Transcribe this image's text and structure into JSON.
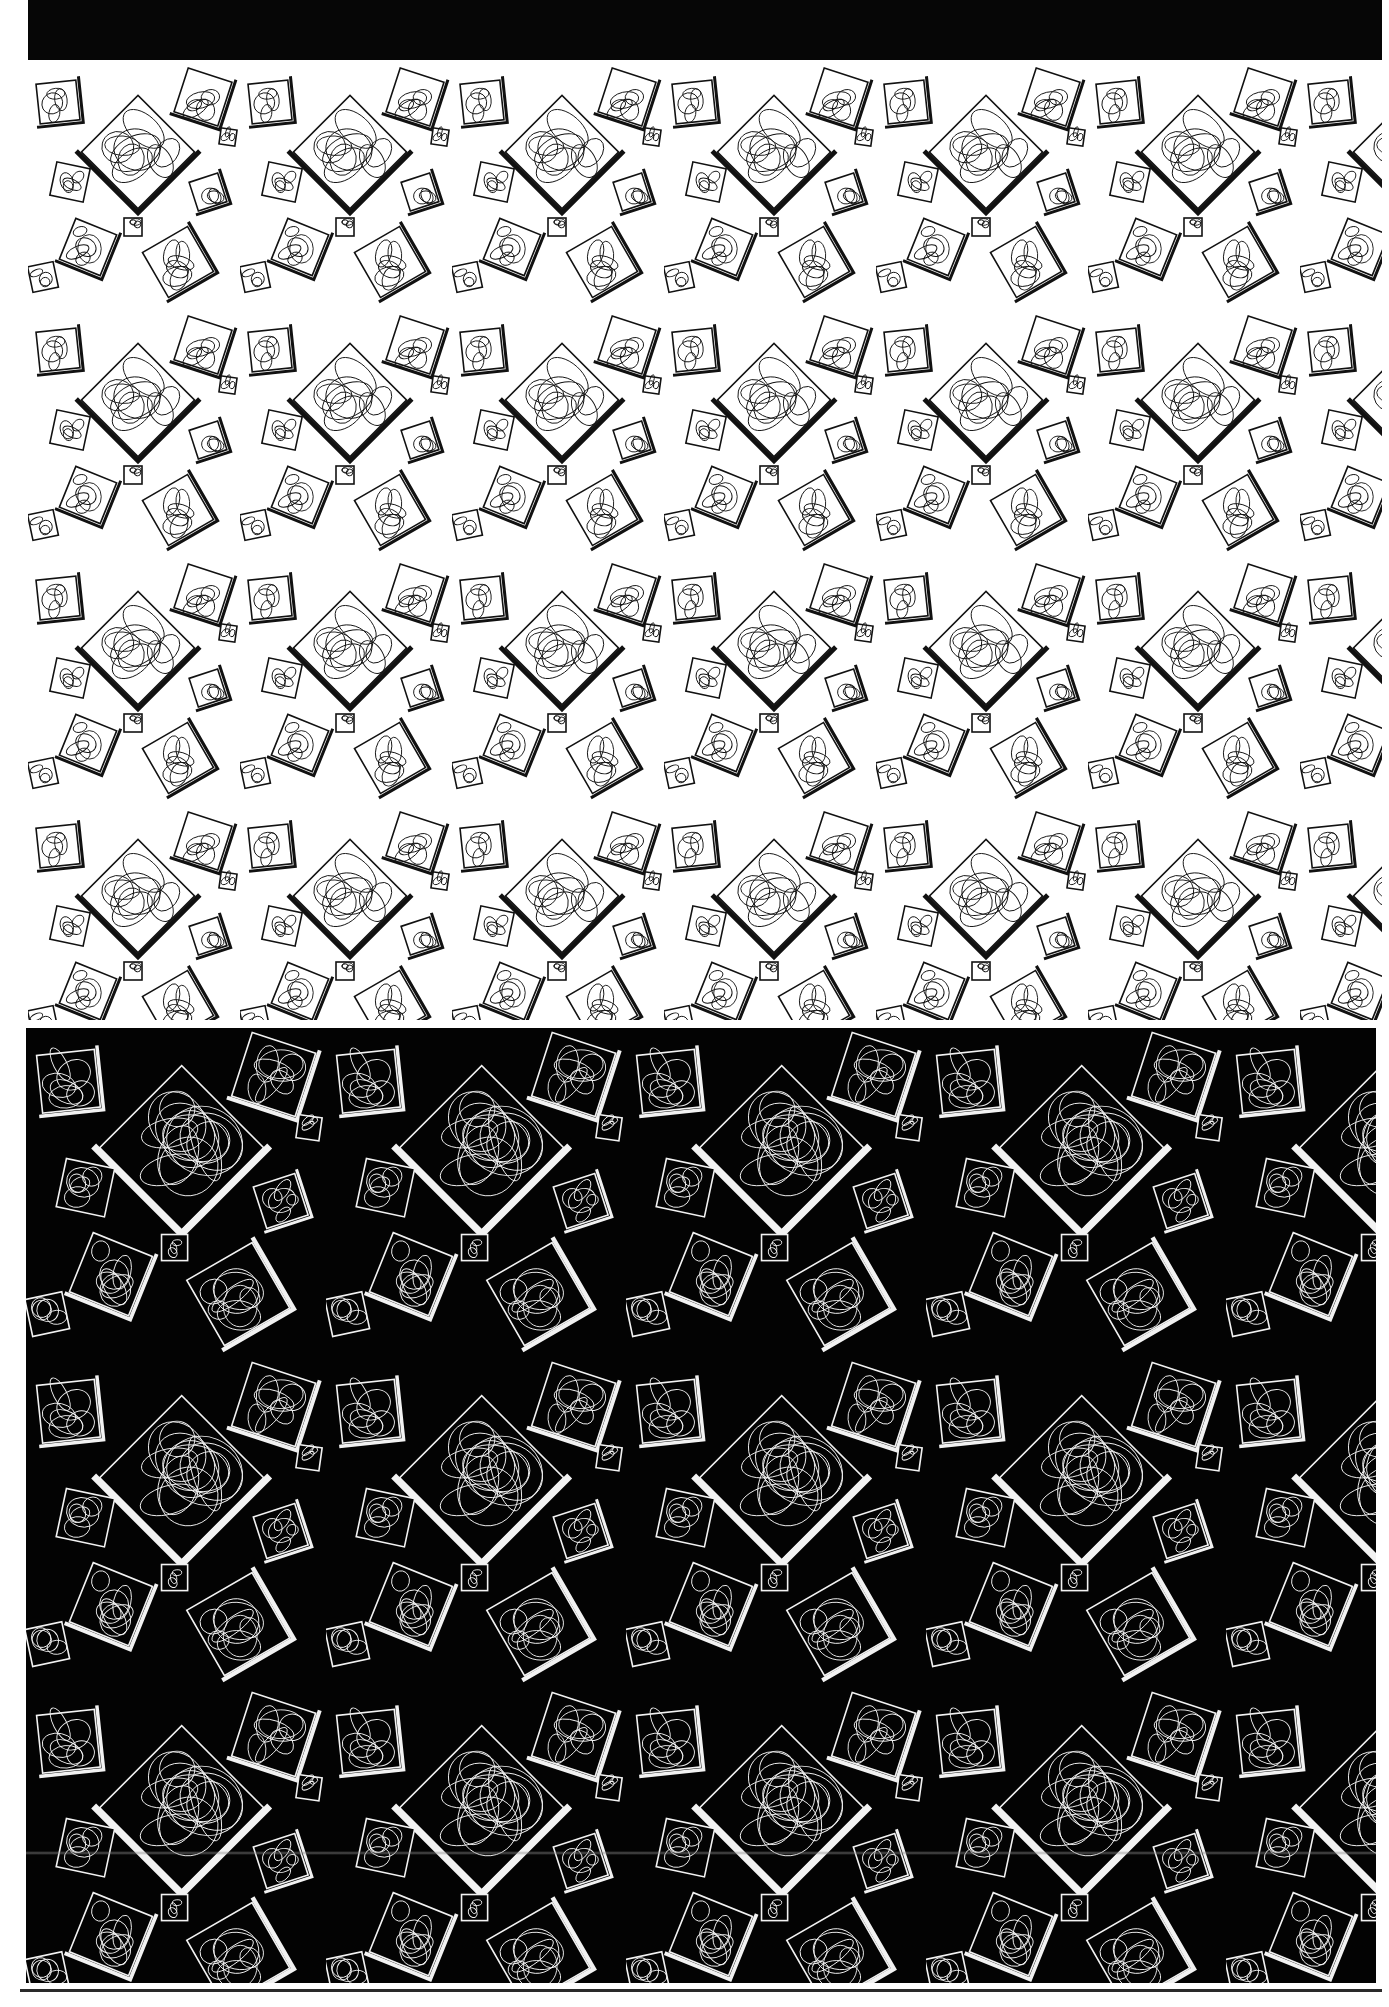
{
  "page": {
    "width": 1389,
    "height": 2007,
    "background": "#ffffff"
  },
  "header_band": {
    "color": "#060606"
  },
  "panels": [
    {
      "id": "light",
      "label": "",
      "background": "#ffffff",
      "ink": "#111111",
      "motif": "scribbled-squares",
      "tile_width": 212,
      "tile_height": 248
    },
    {
      "id": "dark",
      "label": "",
      "background": "#030303",
      "ink": "#f2f2f2",
      "motif": "scribbled-squares",
      "tile_width": 300,
      "tile_height": 330
    }
  ],
  "motif_squares": [
    {
      "x": 110,
      "y": 90,
      "s": 80,
      "r": 45,
      "bar": true
    },
    {
      "x": 30,
      "y": 40,
      "s": 40,
      "r": -6,
      "bar": true
    },
    {
      "x": 175,
      "y": 35,
      "s": 46,
      "r": 18,
      "bar": true
    },
    {
      "x": 42,
      "y": 120,
      "s": 34,
      "r": 12,
      "bar": false
    },
    {
      "x": 180,
      "y": 130,
      "s": 30,
      "r": -18,
      "bar": true
    },
    {
      "x": 60,
      "y": 185,
      "s": 44,
      "r": 22,
      "bar": true
    },
    {
      "x": 150,
      "y": 200,
      "s": 52,
      "r": -30,
      "bar": true
    },
    {
      "x": 105,
      "y": 165,
      "s": 18,
      "r": 0,
      "bar": false
    },
    {
      "x": 200,
      "y": 75,
      "s": 16,
      "r": 8,
      "bar": false
    },
    {
      "x": 15,
      "y": 215,
      "s": 26,
      "r": -12,
      "bar": false
    }
  ],
  "footer_rule": {
    "color": "#2a2a2a"
  }
}
